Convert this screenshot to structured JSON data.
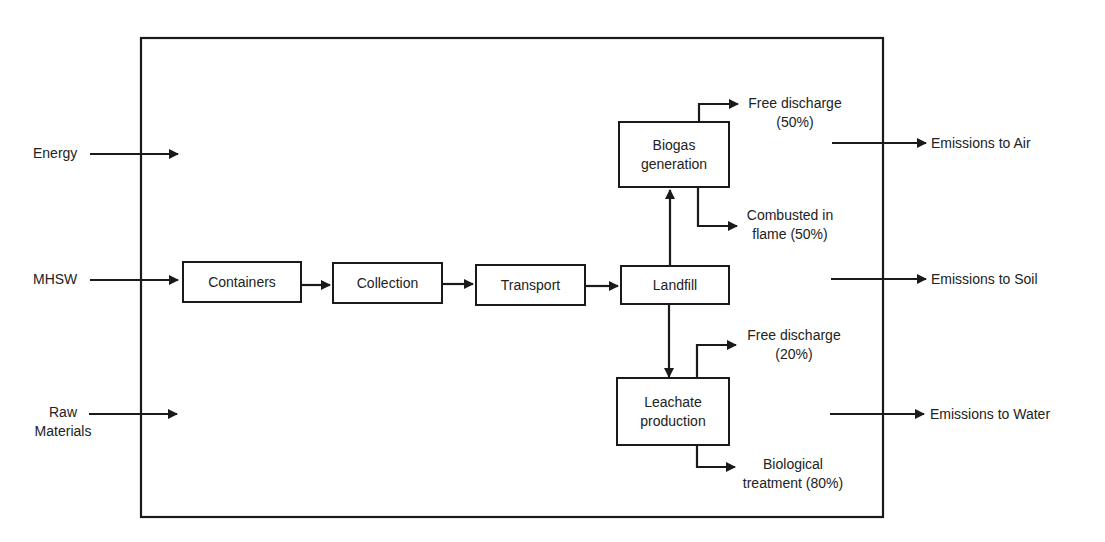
{
  "diagram": {
    "inputs": {
      "energy": "Energy",
      "mhsw": "MHSW",
      "raw_materials_line1": "Raw",
      "raw_materials_line2": "Materials"
    },
    "process": {
      "containers": "Containers",
      "collection": "Collection",
      "transport": "Transport",
      "landfill": "Landfill",
      "biogas_line1": "Biogas",
      "biogas_line2": "generation",
      "leachate_line1": "Leachate",
      "leachate_line2": "production"
    },
    "branches": {
      "biogas_free_line1": "Free discharge",
      "biogas_free_line2": "(50%)",
      "biogas_combusted_line1": "Combusted in",
      "biogas_combusted_line2": "flame (50%)",
      "leachate_free_line1": "Free discharge",
      "leachate_free_line2": "(20%)",
      "leachate_bio_line1": "Biological",
      "leachate_bio_line2": "treatment (80%)"
    },
    "outputs": {
      "air": "Emissions to Air",
      "soil": "Emissions to Soil",
      "water": "Emissions to Water"
    }
  }
}
